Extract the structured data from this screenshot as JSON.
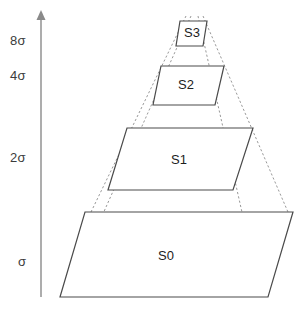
{
  "diagram": {
    "type": "stacked-pyramid",
    "stroke_color": "#4a4a4a",
    "dashed_color": "#8c8c8c",
    "fill_color": "#ffffff",
    "axis": {
      "name": "sigma-axis",
      "orientation": "vertical",
      "arrow": "up",
      "ticks": [
        {
          "label": "8σ",
          "x": 10,
          "y": 33
        },
        {
          "label": "4σ",
          "x": 10,
          "y": 68
        },
        {
          "label": "2σ",
          "x": 10,
          "y": 150
        },
        {
          "label": "σ",
          "x": 18,
          "y": 254
        }
      ]
    },
    "layers": [
      {
        "id": "S0",
        "label": "S0",
        "label_x": 158,
        "label_y": 248,
        "points": "85,212 293,212 268,297 60,297"
      },
      {
        "id": "S1",
        "label": "S1",
        "label_x": 171,
        "label_y": 152,
        "points": "127,128 253,128 233,190 108,190"
      },
      {
        "id": "S2",
        "label": "S2",
        "label_x": 178,
        "label_y": 77,
        "points": "161,66 224,66 215,105 153,105"
      },
      {
        "id": "S3",
        "label": "S3",
        "label_x": 184,
        "label_y": 25,
        "points": "180,21 207,21 203,46 176,46"
      }
    ],
    "pyramid_edges": [
      {
        "name": "front-left-edge",
        "x1": 191,
        "y1": 16,
        "x2": 66,
        "y2": 297
      },
      {
        "name": "front-right-edge",
        "x1": 198,
        "y1": 16,
        "x2": 261,
        "y2": 297
      },
      {
        "name": "back-left-edge",
        "x1": 186,
        "y1": 16,
        "x2": 91,
        "y2": 212
      },
      {
        "name": "back-right-edge",
        "x1": 203,
        "y1": 16,
        "x2": 288,
        "y2": 212
      },
      {
        "name": "hidden-vertical-left",
        "x1": 91,
        "y1": 212,
        "x2": 66,
        "y2": 297
      },
      {
        "name": "hidden-vertical-right",
        "x1": 288,
        "y1": 212,
        "x2": 261,
        "y2": 297
      }
    ]
  }
}
